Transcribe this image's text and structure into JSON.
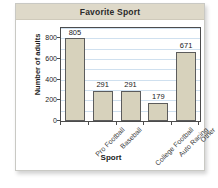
{
  "card": {
    "title": "Favorite Sport"
  },
  "chart_data": {
    "type": "bar",
    "title": "Favorite Sport",
    "xlabel": "Sport",
    "ylabel": "Number of adults",
    "categories": [
      "Pro Football",
      "Baseball",
      "College Football",
      "Auto Racing",
      "Other"
    ],
    "values": [
      805,
      291,
      291,
      179,
      671
    ],
    "ylim": [
      0,
      900
    ],
    "ytick_labels": [
      "0",
      "200",
      "400",
      "600",
      "800"
    ],
    "ytick_values": [
      0,
      200,
      400,
      600,
      800
    ],
    "gridline_values": [
      100,
      200,
      300,
      400,
      500,
      600,
      700,
      800,
      900
    ],
    "grid": true,
    "legend": "none",
    "bar_fill_color": "#d7d2bc",
    "bar_border_color": "#5c5c5c",
    "gridline_color": "#cfe0ef",
    "title_bar_color": "#ded9c9",
    "show_value_labels": true
  }
}
